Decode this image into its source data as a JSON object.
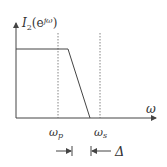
{
  "diagram": {
    "y_label_main": "I",
    "y_label_sub": "2",
    "y_label_arg": "(e",
    "y_label_sup": "jω",
    "y_label_close": ")",
    "x_label": "ω",
    "marker_p": "ω",
    "marker_p_sub": "p",
    "marker_s": "ω",
    "marker_s_sub": "s",
    "delta_label": "Δ"
  }
}
